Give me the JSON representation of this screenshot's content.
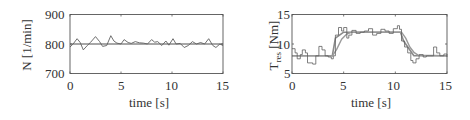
{
  "chart_data": [
    {
      "type": "line",
      "title": "",
      "xlabel": "time [s]",
      "ylabel": "N [1/min]",
      "xlim": [
        0,
        15
      ],
      "ylim": [
        700,
        900
      ],
      "xticks": [
        0,
        5,
        10,
        15
      ],
      "yticks": [
        700,
        800,
        900
      ],
      "grid": false,
      "legend": null,
      "series": [
        {
          "name": "reference",
          "x": [
            0,
            15
          ],
          "y": [
            800,
            800
          ]
        },
        {
          "name": "measured",
          "x": [
            0,
            0.3,
            0.7,
            1.0,
            1.3,
            1.7,
            2.0,
            2.5,
            2.9,
            3.2,
            3.6,
            4.0,
            4.3,
            4.6,
            5.0,
            5.3,
            5.7,
            6.0,
            6.4,
            6.8,
            7.2,
            7.6,
            8.0,
            8.3,
            8.6,
            9.0,
            9.4,
            9.7,
            10.1,
            10.4,
            10.8,
            11.2,
            11.6,
            12.0,
            12.4,
            12.8,
            13.2,
            13.6,
            14.0,
            14.3,
            14.7,
            15.0
          ],
          "y": [
            790,
            800,
            818,
            805,
            780,
            795,
            805,
            825,
            808,
            792,
            795,
            828,
            810,
            803,
            800,
            815,
            805,
            802,
            808,
            804,
            803,
            800,
            815,
            806,
            808,
            795,
            810,
            796,
            818,
            800,
            802,
            788,
            795,
            808,
            800,
            805,
            800,
            818,
            795,
            788,
            800,
            795
          ]
        }
      ]
    },
    {
      "type": "line",
      "title": "",
      "xlabel": "time [s]",
      "ylabel": "T_res [Nm]",
      "xlim": [
        0,
        15
      ],
      "ylim": [
        5,
        15
      ],
      "xticks": [
        0,
        5,
        10,
        15
      ],
      "yticks": [
        5,
        10,
        15
      ],
      "grid": false,
      "legend": null,
      "series": [
        {
          "name": "reference",
          "x": [
            0,
            3.9,
            4.2,
            5.0,
            10.5,
            10.8,
            11.8,
            15
          ],
          "y": [
            8,
            8,
            11,
            12,
            12,
            10.5,
            8,
            8
          ]
        },
        {
          "name": "filtered",
          "x": [
            0,
            3.9,
            4.3,
            4.8,
            5.3,
            5.8,
            10.6,
            11.0,
            11.4,
            11.8,
            12.2,
            15
          ],
          "y": [
            8,
            8,
            9,
            10.8,
            11.7,
            12,
            12,
            11,
            9.5,
            8.6,
            8.1,
            8
          ]
        },
        {
          "name": "measured",
          "x": [
            0,
            0.3,
            0.5,
            0.8,
            1.0,
            1.3,
            1.5,
            2.0,
            2.3,
            2.6,
            2.9,
            3.2,
            3.5,
            3.8,
            4.0,
            4.2,
            4.5,
            4.8,
            5.0,
            5.3,
            5.5,
            5.8,
            6.2,
            6.6,
            7.0,
            7.4,
            7.8,
            8.2,
            8.6,
            9.0,
            9.4,
            9.8,
            10.2,
            10.4,
            10.6,
            10.9,
            11.2,
            11.5,
            11.7,
            12.0,
            12.3,
            12.7,
            13.0,
            13.3,
            13.7,
            14.0,
            14.3,
            14.7,
            15.0
          ],
          "y": [
            9.2,
            8.5,
            7.5,
            8.2,
            9,
            8.5,
            6.8,
            6.6,
            8,
            9.6,
            9,
            8,
            7.8,
            7.5,
            8,
            11.5,
            12.8,
            12.2,
            12.8,
            11,
            11.5,
            12.3,
            11.8,
            12,
            12.2,
            12.6,
            11.5,
            11.8,
            12.5,
            12.2,
            11.8,
            12.6,
            13.1,
            12.5,
            10.5,
            9.5,
            8.5,
            7.2,
            6.8,
            7.5,
            8.2,
            7.8,
            8,
            8,
            9.5,
            8.5,
            8,
            8.3,
            7.8
          ]
        }
      ]
    }
  ],
  "panels": {
    "left": {
      "ylabel": "N [1/min]",
      "xlabel": "time [s]",
      "yticks": [
        "900",
        "800",
        "700"
      ],
      "xticks": [
        "0",
        "5",
        "10",
        "15"
      ]
    },
    "right": {
      "ylabel_main": "T",
      "ylabel_sub": "res",
      "ylabel_unit": " [Nm]",
      "xlabel": "time [s]",
      "yticks": [
        "15",
        "10",
        "5"
      ],
      "xticks": [
        "0",
        "5",
        "10",
        "15"
      ]
    }
  },
  "colors": {
    "axis": "#555555",
    "reference": "#8a8a8a",
    "filtered": "#9a9a9a",
    "measured": "#606060",
    "text": "#333333"
  }
}
